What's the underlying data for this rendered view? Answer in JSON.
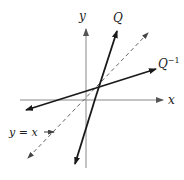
{
  "diagram": {
    "type": "function-inverse-reflection",
    "axes": {
      "x_label": "x",
      "y_label": "y"
    },
    "lines": [
      {
        "name": "Q",
        "label": "Q",
        "style": "solid",
        "color": "#1a1a1a"
      },
      {
        "name": "Q-inverse",
        "label": "Q",
        "label_superscript": "−1",
        "style": "solid",
        "color": "#1a1a1a"
      },
      {
        "name": "identity",
        "label": "y = x",
        "style": "dashed",
        "color": "#555555"
      }
    ],
    "colors": {
      "axis": "#888888",
      "line": "#1a1a1a",
      "dashed": "#666666",
      "text": "#222222"
    }
  }
}
